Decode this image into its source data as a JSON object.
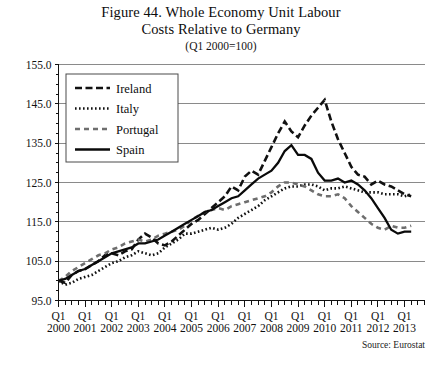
{
  "figure": {
    "title_line1": "Figure 44. Whole Economy Unit Labour",
    "title_line2": "Costs Relative to Germany",
    "subtitle": "(Q1 2000=100)",
    "source": "Source: Eurostat"
  },
  "chart_data": {
    "type": "line",
    "title": "Figure 44. Whole Economy Unit Labour Costs Relative to Germany",
    "subtitle": "(Q1 2000=100)",
    "xlabel": "",
    "ylabel": "",
    "ylim": [
      95.0,
      155.0
    ],
    "yticks": [
      "95.0",
      "105.0",
      "115.0",
      "125.0",
      "135.0",
      "145.0",
      "155.0"
    ],
    "ytick_values": [
      95.0,
      105.0,
      115.0,
      125.0,
      135.0,
      145.0,
      155.0
    ],
    "grid": "horizontal",
    "legend_position": "upper-left-inside",
    "x_tick_prefix": "Q1",
    "x_tick_years": [
      "2000",
      "2001",
      "2002",
      "2003",
      "2004",
      "2005",
      "2006",
      "2007",
      "2008",
      "2009",
      "2010",
      "2011",
      "2012",
      "2013"
    ],
    "x_minor_ticks_per_year": 4,
    "x_quarters": [
      "2000Q1",
      "2000Q2",
      "2000Q3",
      "2000Q4",
      "2001Q1",
      "2001Q2",
      "2001Q3",
      "2001Q4",
      "2002Q1",
      "2002Q2",
      "2002Q3",
      "2002Q4",
      "2003Q1",
      "2003Q2",
      "2003Q3",
      "2003Q4",
      "2004Q1",
      "2004Q2",
      "2004Q3",
      "2004Q4",
      "2005Q1",
      "2005Q2",
      "2005Q3",
      "2005Q4",
      "2006Q1",
      "2006Q2",
      "2006Q3",
      "2006Q4",
      "2007Q1",
      "2007Q2",
      "2007Q3",
      "2007Q4",
      "2008Q1",
      "2008Q2",
      "2008Q3",
      "2008Q4",
      "2009Q1",
      "2009Q2",
      "2009Q3",
      "2009Q4",
      "2010Q1",
      "2010Q2",
      "2010Q3",
      "2010Q4",
      "2011Q1",
      "2011Q2",
      "2011Q3",
      "2011Q4",
      "2012Q1",
      "2012Q2",
      "2012Q3",
      "2012Q4",
      "2013Q1",
      "2013Q2"
    ],
    "series": [
      {
        "name": "Ireland",
        "style": "dashed",
        "color": "#111111",
        "width": 2.6,
        "dash": "7,3.5",
        "values": [
          100.0,
          99.5,
          101.5,
          102.5,
          103.0,
          104.0,
          105.0,
          106.5,
          107.0,
          106.5,
          107.5,
          108.0,
          110.5,
          112.0,
          111.0,
          109.5,
          109.0,
          110.0,
          111.5,
          113.0,
          114.5,
          115.5,
          117.0,
          118.5,
          120.0,
          121.5,
          124.0,
          123.0,
          126.5,
          128.0,
          127.0,
          130.5,
          134.0,
          137.5,
          140.5,
          138.0,
          136.5,
          139.5,
          142.0,
          144.0,
          146.0,
          140.5,
          136.0,
          132.5,
          129.0,
          127.0,
          126.5,
          124.5,
          125.5,
          124.5,
          124.0,
          123.0,
          122.0,
          121.5
        ]
      },
      {
        "name": "Italy",
        "style": "dotted",
        "color": "#111111",
        "width": 2.6,
        "dash": "1.6,2.4",
        "values": [
          100.0,
          99.0,
          99.5,
          100.5,
          101.0,
          101.5,
          102.5,
          103.5,
          104.5,
          105.0,
          106.0,
          106.5,
          107.5,
          107.0,
          106.5,
          107.0,
          108.5,
          109.5,
          110.5,
          112.0,
          112.0,
          112.5,
          113.0,
          113.5,
          113.0,
          113.5,
          114.5,
          116.0,
          117.0,
          118.0,
          119.0,
          120.5,
          121.5,
          122.5,
          123.5,
          124.0,
          124.0,
          124.5,
          124.5,
          124.0,
          123.0,
          123.5,
          123.5,
          124.0,
          123.5,
          123.0,
          122.5,
          122.5,
          122.5,
          122.0,
          122.0,
          122.0,
          121.5,
          122.0
        ]
      },
      {
        "name": "Portugal",
        "style": "dashed-grey",
        "color": "#6e6e6e",
        "width": 2.6,
        "dash": "5,4",
        "values": [
          100.0,
          101.0,
          102.5,
          103.5,
          104.5,
          105.5,
          106.5,
          107.0,
          108.0,
          108.5,
          109.5,
          110.0,
          110.5,
          110.0,
          110.5,
          111.5,
          112.0,
          112.5,
          113.0,
          114.0,
          115.5,
          116.5,
          117.5,
          118.0,
          118.5,
          118.0,
          119.0,
          119.5,
          120.0,
          120.5,
          121.0,
          121.5,
          122.5,
          124.0,
          125.0,
          125.0,
          124.5,
          124.0,
          123.0,
          122.0,
          121.5,
          121.5,
          122.0,
          121.0,
          119.0,
          117.5,
          116.0,
          114.5,
          113.5,
          113.0,
          114.0,
          113.5,
          113.5,
          114.0
        ]
      },
      {
        "name": "Spain",
        "style": "solid",
        "color": "#0a0a0a",
        "width": 2.3,
        "dash": "none",
        "values": [
          100.0,
          100.5,
          101.5,
          102.5,
          103.0,
          104.0,
          105.0,
          106.0,
          107.0,
          107.5,
          108.0,
          108.5,
          109.5,
          109.5,
          110.0,
          110.5,
          111.5,
          112.5,
          113.5,
          114.5,
          115.5,
          116.5,
          117.5,
          118.0,
          119.0,
          120.0,
          121.0,
          121.5,
          123.0,
          124.5,
          126.0,
          127.0,
          128.0,
          130.0,
          133.0,
          134.5,
          132.0,
          132.0,
          131.0,
          127.5,
          125.5,
          125.5,
          126.0,
          125.0,
          125.5,
          124.5,
          123.0,
          121.0,
          118.5,
          116.0,
          113.0,
          112.0,
          112.5,
          112.5
        ]
      }
    ],
    "annotations": [],
    "peaks": {
      "Ireland": {
        "value": 146.0,
        "quarter": "2010Q1"
      },
      "Spain": {
        "value": 134.5,
        "quarter": "2008Q4"
      },
      "Portugal": {
        "value": 125.0,
        "quarter": "2008Q3"
      },
      "Italy": {
        "value": 124.5,
        "quarter": "2009Q2"
      }
    }
  },
  "legend": {
    "items": [
      {
        "label": "Ireland"
      },
      {
        "label": "Italy"
      },
      {
        "label": "Portugal"
      },
      {
        "label": "Spain"
      }
    ]
  }
}
